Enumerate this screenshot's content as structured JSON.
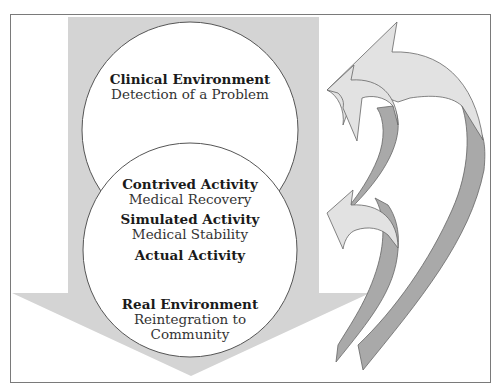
{
  "diagram": {
    "colors": {
      "frame": "#7a7a7a",
      "down_arrow": "#d4d4d4",
      "circle_fill": "#ffffff",
      "circle_stroke": "#555555",
      "curved_arrow_light": "#e2e2e2",
      "curved_arrow_dark": "#a9a9a9"
    },
    "top_circle": {
      "title": "Clinical Environment",
      "subtitle": "Detection of a Problem"
    },
    "bottom_circle": {
      "items": [
        {
          "title": "Contrived Activity",
          "subtitle": "Medical Recovery"
        },
        {
          "title": "Simulated Activity",
          "subtitle": "Medical Stability"
        },
        {
          "title": "Actual Activity",
          "subtitle": ""
        }
      ],
      "footer_title": "Real Environment",
      "footer_subtitle_line1": "Reintegration to",
      "footer_subtitle_line2": "Community"
    },
    "feedback_arrows": [
      {
        "name": "large-feedback-arrow",
        "direction": "up-left"
      },
      {
        "name": "small-feedback-arrow",
        "direction": "up-left"
      }
    ]
  }
}
